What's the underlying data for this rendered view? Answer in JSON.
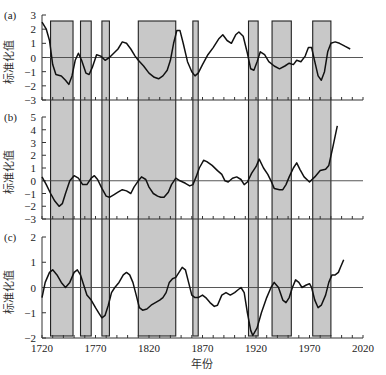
{
  "chart_data": {
    "type": "line",
    "xlabel": "年份",
    "xlim": [
      1720,
      2020
    ],
    "xticks": [
      1720,
      1770,
      1820,
      1870,
      1920,
      1970,
      2020
    ],
    "shaded_periods": [
      [
        1728,
        1749
      ],
      [
        1756,
        1766
      ],
      [
        1776,
        1783
      ],
      [
        1810,
        1845
      ],
      [
        1861,
        1866
      ],
      [
        1913,
        1922
      ],
      [
        1935,
        1953
      ],
      [
        1973,
        1990
      ]
    ],
    "shade_color": "#c8c8c8",
    "panels": [
      {
        "label": "(a)",
        "ylabel": "标准化值",
        "ylim": [
          -3,
          3
        ],
        "yticks": [
          3,
          2,
          1,
          0,
          -1,
          -2,
          -3
        ],
        "x": [
          1720,
          1724,
          1727,
          1730,
          1733,
          1738,
          1742,
          1745,
          1748,
          1751,
          1754,
          1757,
          1761,
          1764,
          1767,
          1771,
          1775,
          1779,
          1783,
          1787,
          1791,
          1795,
          1799,
          1803,
          1807,
          1810,
          1815,
          1820,
          1825,
          1829,
          1833,
          1837,
          1840,
          1843,
          1846,
          1849,
          1852,
          1856,
          1860,
          1863,
          1866,
          1870,
          1875,
          1880,
          1885,
          1889,
          1893,
          1897,
          1901,
          1904,
          1908,
          1912,
          1915,
          1918,
          1921,
          1924,
          1928,
          1932,
          1937,
          1942,
          1947,
          1951,
          1955,
          1958,
          1962,
          1966,
          1969,
          1972,
          1975,
          1978,
          1981,
          1984,
          1987,
          1990,
          1994,
          1998,
          2003,
          2008
        ],
        "y": [
          2.5,
          2.0,
          1.2,
          -0.5,
          -1.2,
          -1.3,
          -1.6,
          -1.9,
          -1.3,
          -0.2,
          0.3,
          -0.2,
          -1.1,
          -1.2,
          -0.7,
          0.2,
          0.1,
          -0.2,
          0.0,
          0.3,
          0.6,
          1.1,
          1.0,
          0.6,
          0.1,
          -0.2,
          -0.6,
          -1.1,
          -1.4,
          -1.5,
          -1.3,
          -0.9,
          -0.2,
          1.0,
          1.9,
          1.9,
          1.0,
          -0.3,
          -1.0,
          -1.3,
          -1.1,
          -0.5,
          0.2,
          0.7,
          1.3,
          1.6,
          1.2,
          1.0,
          1.6,
          1.8,
          1.5,
          0.3,
          -0.8,
          -0.9,
          -0.3,
          0.4,
          0.2,
          -0.3,
          -0.6,
          -0.8,
          -0.6,
          -0.4,
          -0.5,
          -0.2,
          -0.3,
          0.1,
          0.7,
          0.7,
          -0.3,
          -1.3,
          -1.6,
          -1.0,
          0.4,
          1.0,
          1.1,
          1.0,
          0.8,
          0.6
        ]
      },
      {
        "label": "(b)",
        "ylabel": "标准化值",
        "ylim": [
          -3,
          5
        ],
        "yticks": [
          5,
          4,
          3,
          2,
          1,
          0,
          -1,
          -2,
          -3
        ],
        "x": [
          1720,
          1724,
          1728,
          1732,
          1736,
          1739,
          1742,
          1746,
          1750,
          1754,
          1758,
          1762,
          1766,
          1769,
          1772,
          1776,
          1780,
          1783,
          1787,
          1791,
          1795,
          1799,
          1803,
          1806,
          1810,
          1813,
          1817,
          1820,
          1824,
          1828,
          1831,
          1834,
          1838,
          1841,
          1845,
          1849,
          1854,
          1858,
          1861,
          1864,
          1867,
          1871,
          1874,
          1879,
          1884,
          1888,
          1891,
          1894,
          1898,
          1902,
          1906,
          1909,
          1912,
          1916,
          1920,
          1923,
          1927,
          1931,
          1934,
          1937,
          1942,
          1945,
          1948,
          1951,
          1955,
          1958,
          1961,
          1965,
          1970,
          1975,
          1980,
          1985,
          1988,
          1992,
          1996
        ],
        "y": [
          0.3,
          -0.3,
          -1.0,
          -1.6,
          -2.0,
          -1.8,
          -1.0,
          0.0,
          0.4,
          0.2,
          -0.3,
          -0.3,
          0.2,
          0.4,
          0.1,
          -0.6,
          -1.2,
          -1.3,
          -1.1,
          -0.9,
          -0.7,
          -0.8,
          -1.0,
          -0.5,
          0.0,
          0.3,
          0.1,
          -0.5,
          -1.0,
          -1.2,
          -1.3,
          -1.3,
          -0.9,
          -0.3,
          0.2,
          0.0,
          -0.2,
          -0.4,
          -0.3,
          0.3,
          1.0,
          1.6,
          1.5,
          1.2,
          0.8,
          0.5,
          0.0,
          -0.1,
          0.2,
          0.3,
          0.1,
          -0.3,
          -0.1,
          0.6,
          1.1,
          1.7,
          1.0,
          0.5,
          0.0,
          -0.6,
          -0.7,
          -0.7,
          -0.3,
          0.3,
          1.0,
          1.4,
          0.9,
          0.3,
          -0.1,
          0.3,
          0.8,
          0.9,
          1.2,
          2.7,
          4.3
        ]
      },
      {
        "label": "(c)",
        "ylabel": "标准化值",
        "ylim": [
          -2,
          2
        ],
        "yticks": [
          2,
          1,
          0,
          -1,
          -2
        ],
        "x": [
          1720,
          1723,
          1727,
          1730,
          1734,
          1738,
          1742,
          1746,
          1750,
          1753,
          1756,
          1759,
          1762,
          1766,
          1770,
          1773,
          1776,
          1779,
          1782,
          1785,
          1788,
          1792,
          1796,
          1799,
          1802,
          1805,
          1808,
          1811,
          1814,
          1818,
          1822,
          1826,
          1830,
          1833,
          1836,
          1839,
          1842,
          1845,
          1848,
          1851,
          1854,
          1857,
          1860,
          1863,
          1866,
          1870,
          1873,
          1877,
          1881,
          1884,
          1888,
          1892,
          1896,
          1900,
          1903,
          1906,
          1909,
          1912,
          1915,
          1917,
          1921,
          1925,
          1930,
          1934,
          1937,
          1941,
          1945,
          1948,
          1951,
          1954,
          1957,
          1960,
          1963,
          1967,
          1970,
          1972,
          1975,
          1978,
          1981,
          1985,
          1988,
          1991,
          1994,
          1997,
          1999,
          2002
        ],
        "y": [
          -0.4,
          0.2,
          0.6,
          0.7,
          0.5,
          0.2,
          0.0,
          0.2,
          0.6,
          0.7,
          0.5,
          0.1,
          -0.3,
          -0.5,
          -0.8,
          -1.0,
          -1.2,
          -1.1,
          -0.7,
          -0.2,
          0.0,
          0.2,
          0.5,
          0.6,
          0.5,
          0.2,
          -0.3,
          -0.8,
          -0.9,
          -0.85,
          -0.7,
          -0.6,
          -0.5,
          -0.4,
          -0.2,
          0.2,
          0.35,
          0.4,
          0.6,
          0.8,
          0.7,
          0.2,
          -0.3,
          -0.4,
          -0.4,
          -0.3,
          -0.4,
          -0.6,
          -0.75,
          -0.7,
          -0.3,
          -0.2,
          -0.3,
          -0.2,
          -0.1,
          0.0,
          -0.2,
          -1.0,
          -1.7,
          -1.9,
          -1.6,
          -1.0,
          -0.4,
          0.0,
          0.2,
          0.0,
          -0.5,
          -0.6,
          -0.4,
          0.0,
          0.3,
          0.2,
          0.0,
          0.1,
          0.15,
          0.0,
          -0.5,
          -0.8,
          -0.7,
          -0.3,
          0.2,
          0.5,
          0.5,
          0.6,
          0.8,
          1.1
        ]
      }
    ]
  }
}
